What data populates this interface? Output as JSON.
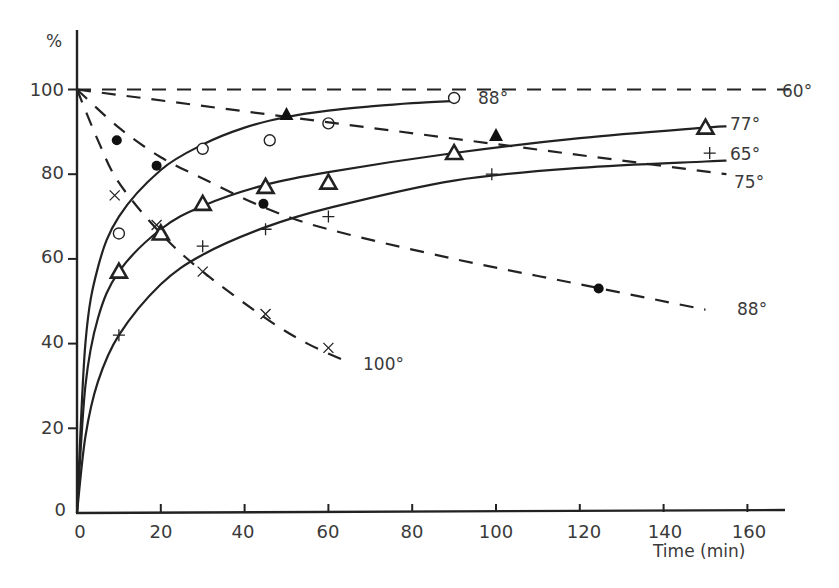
{
  "chart_data": {
    "type": "scatter",
    "title": "",
    "xlabel": "Time (min)",
    "ylabel": "%",
    "xlim": [
      0,
      170
    ],
    "ylim": [
      0,
      110
    ],
    "x_ticks": [
      0,
      20,
      40,
      60,
      80,
      100,
      120,
      140,
      160
    ],
    "y_ticks": [
      0,
      20,
      40,
      60,
      80,
      100
    ],
    "grid": false,
    "legend": "inline curve labels",
    "series": [
      {
        "name": "88°",
        "style": "solid",
        "marker": "open-circle",
        "points": [
          [
            10,
            66
          ],
          [
            30,
            86
          ],
          [
            46,
            88
          ],
          [
            60,
            92
          ],
          [
            90,
            98
          ]
        ],
        "curve": [
          [
            0,
            0
          ],
          [
            2,
            40
          ],
          [
            5,
            58
          ],
          [
            10,
            70
          ],
          [
            20,
            81
          ],
          [
            30,
            87
          ],
          [
            40,
            91
          ],
          [
            50,
            93.5
          ],
          [
            60,
            95
          ],
          [
            70,
            96
          ],
          [
            80,
            96.8
          ],
          [
            90,
            97.3
          ]
        ],
        "label": "88°"
      },
      {
        "name": "77°",
        "style": "solid",
        "marker": "open-triangle",
        "points": [
          [
            10,
            57
          ],
          [
            20,
            66
          ],
          [
            30,
            73
          ],
          [
            45,
            77
          ],
          [
            60,
            78
          ],
          [
            90,
            85
          ],
          [
            150,
            91
          ]
        ],
        "curve": [
          [
            0,
            0
          ],
          [
            2,
            30
          ],
          [
            5,
            46
          ],
          [
            10,
            57
          ],
          [
            20,
            67
          ],
          [
            30,
            72.5
          ],
          [
            45,
            77.5
          ],
          [
            60,
            80.5
          ],
          [
            90,
            85
          ],
          [
            120,
            88.5
          ],
          [
            150,
            91
          ],
          [
            155,
            91.3
          ]
        ],
        "label": "77°"
      },
      {
        "name": "65°",
        "style": "solid",
        "marker": "plus",
        "points": [
          [
            10,
            42
          ],
          [
            30,
            63
          ],
          [
            45,
            67
          ],
          [
            60,
            70
          ],
          [
            99,
            80
          ],
          [
            151,
            85
          ]
        ],
        "curve": [
          [
            0,
            0
          ],
          [
            2,
            18
          ],
          [
            5,
            31
          ],
          [
            10,
            42
          ],
          [
            20,
            54
          ],
          [
            30,
            61
          ],
          [
            45,
            67.5
          ],
          [
            60,
            72
          ],
          [
            90,
            78.5
          ],
          [
            120,
            81.5
          ],
          [
            150,
            83
          ],
          [
            155,
            83.2
          ]
        ],
        "label": "65°"
      },
      {
        "name": "60°",
        "style": "dashed",
        "marker": "none",
        "points": [],
        "curve": [
          [
            0,
            100
          ],
          [
            170,
            100
          ]
        ],
        "label": "60°"
      },
      {
        "name": "75°",
        "style": "dashed",
        "marker": "filled-triangle",
        "points": [
          [
            50,
            94
          ],
          [
            100,
            89
          ]
        ],
        "curve": [
          [
            0,
            100
          ],
          [
            155,
            80
          ]
        ],
        "label": "75°"
      },
      {
        "name": "88° (dashed)",
        "style": "dashed",
        "marker": "filled-circle",
        "points": [
          [
            9.5,
            88
          ],
          [
            19,
            82
          ],
          [
            44.5,
            73
          ],
          [
            124.5,
            53
          ]
        ],
        "curve": [
          [
            0,
            100
          ],
          [
            10,
            91
          ],
          [
            20,
            84
          ],
          [
            30,
            79
          ],
          [
            45,
            72
          ],
          [
            60,
            67
          ],
          [
            90,
            60
          ],
          [
            120,
            54
          ],
          [
            150,
            48
          ]
        ],
        "label": "88°"
      },
      {
        "name": "100°",
        "style": "dashed",
        "marker": "cross",
        "points": [
          [
            9,
            75
          ],
          [
            19,
            68
          ],
          [
            30,
            57
          ],
          [
            45,
            47
          ],
          [
            60,
            39
          ]
        ],
        "curve": [
          [
            0,
            100
          ],
          [
            5,
            88
          ],
          [
            10,
            78
          ],
          [
            20,
            66
          ],
          [
            30,
            57
          ],
          [
            45,
            46
          ],
          [
            55,
            40
          ],
          [
            65,
            35.5
          ]
        ],
        "label": "100°"
      }
    ]
  },
  "axes": {
    "x_label": "Time (min)",
    "y_label": "%",
    "x_tick_labels": [
      "0",
      "20",
      "40",
      "60",
      "80",
      "100",
      "120",
      "140",
      "160"
    ],
    "y_tick_labels": [
      "0",
      "20",
      "40",
      "60",
      "80",
      "100"
    ]
  },
  "labels": {
    "l88_solid": "88°",
    "l77": "77°",
    "l65": "65°",
    "l60": "60°",
    "l75": "75°",
    "l88_dashed": "88°",
    "l100": "100°"
  }
}
